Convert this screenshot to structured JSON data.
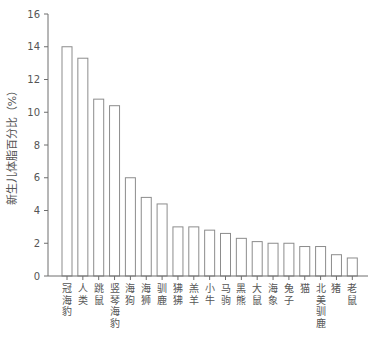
{
  "chart_data": {
    "type": "bar",
    "title": "",
    "xlabel": "",
    "ylabel": "新生儿体脂百分比（%）",
    "ylim": [
      0,
      16
    ],
    "yticks": [
      0,
      2,
      4,
      6,
      8,
      10,
      12,
      14,
      16
    ],
    "grid": false,
    "legend": null,
    "bar_style": {
      "fill": "#ffffff",
      "stroke": "#8c8c8c"
    },
    "categories": [
      "冠海豹",
      "人类",
      "跳鼠",
      "竖琴海豹",
      "海狗",
      "海狮",
      "驯鹿",
      "狒狒",
      "羔羊",
      "小牛",
      "马驹",
      "黑熊",
      "大鼠",
      "海象",
      "兔子",
      "猫",
      "北美驯鹿",
      "猪",
      "老鼠"
    ],
    "values": [
      14.0,
      13.3,
      10.8,
      10.4,
      6.0,
      4.8,
      4.4,
      3.0,
      3.0,
      2.8,
      2.6,
      2.3,
      2.1,
      2.0,
      2.0,
      1.8,
      1.8,
      1.3,
      1.1
    ]
  }
}
